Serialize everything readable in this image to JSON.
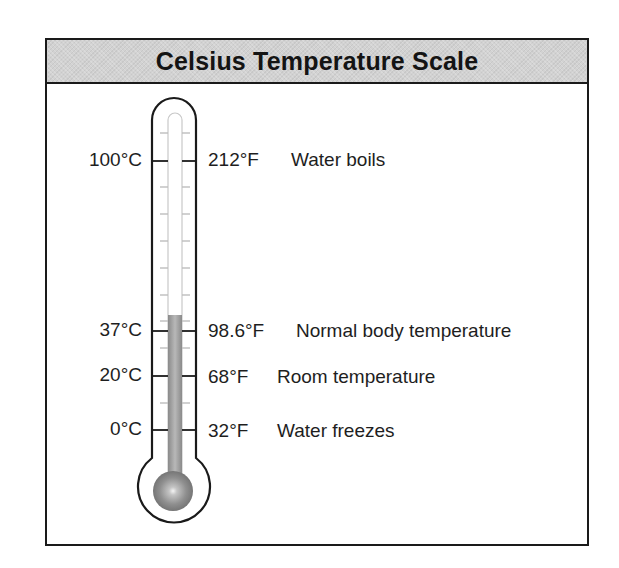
{
  "title": "Celsius Temperature Scale",
  "colors": {
    "header_bg": "#d2d2d2",
    "border": "#1a1a1a",
    "mercury": "#9a9a9a",
    "bulb": "#8c8c8c"
  },
  "thermometer": {
    "mercury_level_celsius": 37,
    "markers": [
      {
        "celsius": "100°C",
        "fahrenheit": "212°F",
        "description": "Water boils"
      },
      {
        "celsius": "37°C",
        "fahrenheit": "98.6°F",
        "description": "Normal body temperature"
      },
      {
        "celsius": "20°C",
        "fahrenheit": "68°F",
        "description": "Room temperature"
      },
      {
        "celsius": "0°C",
        "fahrenheit": "32°F",
        "description": "Water freezes"
      }
    ]
  }
}
